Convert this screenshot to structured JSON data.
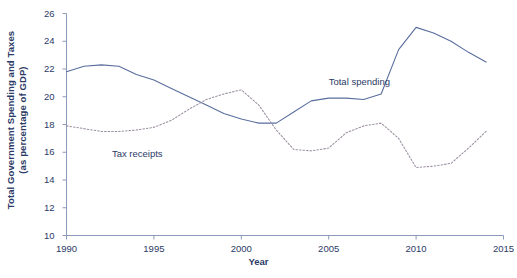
{
  "chart_data": {
    "type": "line",
    "title": "",
    "xlabel": "Year",
    "ylabel": "Total Government Spending and Taxes (as percentage of GDP)",
    "ylabel_line1": "Total Government Spending and Taxes",
    "ylabel_line2": "(as percentage of GDP)",
    "xlim": [
      1990,
      2015
    ],
    "ylim": [
      10,
      26
    ],
    "xticks": [
      1990,
      1995,
      2000,
      2005,
      2010,
      2015
    ],
    "yticks": [
      10,
      12,
      14,
      16,
      18,
      20,
      22,
      24,
      26
    ],
    "xtick_labels": [
      "1990",
      "1995",
      "2000",
      "2005",
      "2010",
      "2015"
    ],
    "ytick_labels": [
      "10",
      "12",
      "14",
      "16",
      "18",
      "20",
      "22",
      "24",
      "26"
    ],
    "grid": false,
    "legend_position": "inline-annotations",
    "line_color": "#5a6e9e",
    "series": [
      {
        "name": "Total spending",
        "style": "solid",
        "color": "#5a6e9e",
        "label_text": "Total spending",
        "x": [
          1990,
          1991,
          1992,
          1993,
          1994,
          1995,
          1996,
          1997,
          1998,
          1999,
          2000,
          2001,
          2002,
          2003,
          2004,
          2005,
          2006,
          2007,
          2008,
          2009,
          2010,
          2011,
          2012,
          2013,
          2014
        ],
        "values": [
          21.8,
          22.2,
          22.3,
          22.2,
          21.6,
          21.2,
          20.6,
          20.0,
          19.4,
          18.8,
          18.4,
          18.1,
          18.1,
          18.9,
          19.7,
          19.9,
          19.9,
          19.8,
          20.2,
          23.4,
          25.0,
          24.6,
          24.0,
          23.2,
          22.5
        ]
      },
      {
        "name": "Tax receipts",
        "style": "dotted",
        "color": "#9a8fa0",
        "label_text": "Tax receipts",
        "x": [
          1990,
          1991,
          1992,
          1993,
          1994,
          1995,
          1996,
          1997,
          1998,
          1999,
          2000,
          2001,
          2002,
          2003,
          2004,
          2005,
          2006,
          2007,
          2008,
          2009,
          2010,
          2011,
          2012,
          2013,
          2014
        ],
        "values": [
          17.9,
          17.7,
          17.5,
          17.5,
          17.6,
          17.8,
          18.3,
          19.1,
          19.8,
          20.2,
          20.5,
          19.4,
          17.6,
          16.2,
          16.1,
          16.3,
          17.4,
          17.9,
          18.1,
          17.0,
          14.9,
          15.0,
          15.2,
          16.3,
          17.5
        ]
      }
    ],
    "annotations": [
      {
        "text": "Total spending",
        "x": 2005,
        "y": 21.0
      },
      {
        "text": "Tax receipts",
        "x": 1992.6,
        "y": 15.8
      }
    ]
  }
}
